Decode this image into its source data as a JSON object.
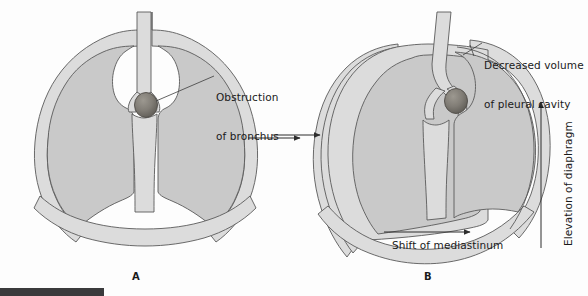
{
  "figure": {
    "title_semantic": "lung-collapse-atelectasis-diagram",
    "panels": [
      {
        "id": "A",
        "letter": "A",
        "description": "Normal thorax with bronchial obstruction"
      },
      {
        "id": "B",
        "letter": "B",
        "description": "Collapsed lung with mediastinal shift and elevated diaphragm"
      }
    ],
    "labels": {
      "obstruction": "Obstruction\nof bronchus",
      "obstruction_line1": "Obstruction",
      "obstruction_line2": "of bronchus",
      "decreased_volume": "Decreased volume\nof pleural cavity",
      "decreased_volume_line1": "Decreased volume",
      "decreased_volume_line2": "of pleural cavity",
      "shift_of_mediastinum": "Shift of mediastinum",
      "elevation_of_diaphragm": "Elevation of diaphragm"
    },
    "arrows": [
      {
        "name": "transition-arrow",
        "direction": "right"
      },
      {
        "name": "pleural-compression-arrow",
        "direction": "right"
      },
      {
        "name": "shift-of-mediastinum-arrow",
        "direction": "right"
      },
      {
        "name": "elevation-of-diaphragm-arrow",
        "direction": "up"
      }
    ],
    "colors": {
      "lung_fill": "#c9c9c9",
      "pleura_fill": "#dcdcdc",
      "outline": "#5a5a5a",
      "obstruction_fill": "#7d7a74",
      "background": "#fdfdfd",
      "bottom_bar": "#3a3a3c",
      "text": "#1a1a1a"
    }
  }
}
